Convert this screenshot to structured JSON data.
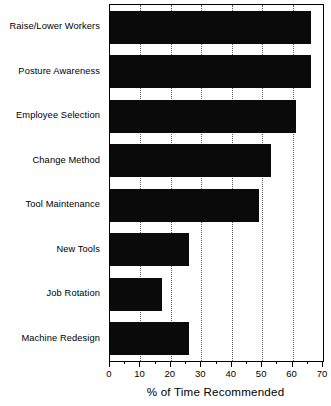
{
  "chart_data": {
    "type": "bar",
    "orientation": "horizontal",
    "title": "",
    "xlabel": "% of Time Recommended",
    "ylabel": "",
    "xlim": [
      0,
      70
    ],
    "xticks": [
      0,
      10,
      20,
      30,
      40,
      50,
      60,
      70
    ],
    "xtick_labels": [
      "0",
      "10",
      "20",
      "30",
      "40",
      "50",
      "60",
      "70"
    ],
    "minor_ticks": [
      5,
      15,
      25,
      35,
      45,
      55,
      65
    ],
    "gridlines": [
      10,
      20,
      30,
      40,
      50,
      60
    ],
    "grid": true,
    "grid_style": "dotted-vertical",
    "legend": null,
    "bar_color": "#0a0a0a",
    "frame_color": "#000000",
    "background": "#ffffff",
    "categories": [
      "Raise/Lower Workers",
      "Posture Awareness",
      "Employee Selection",
      "Change Method",
      "Tool Maintenance",
      "New Tools",
      "Job Rotation",
      "Machine Redesign"
    ],
    "values": [
      66,
      66,
      61,
      53,
      49,
      26,
      17,
      26
    ]
  },
  "axis": {
    "x_title": "% of Time Recommended"
  }
}
